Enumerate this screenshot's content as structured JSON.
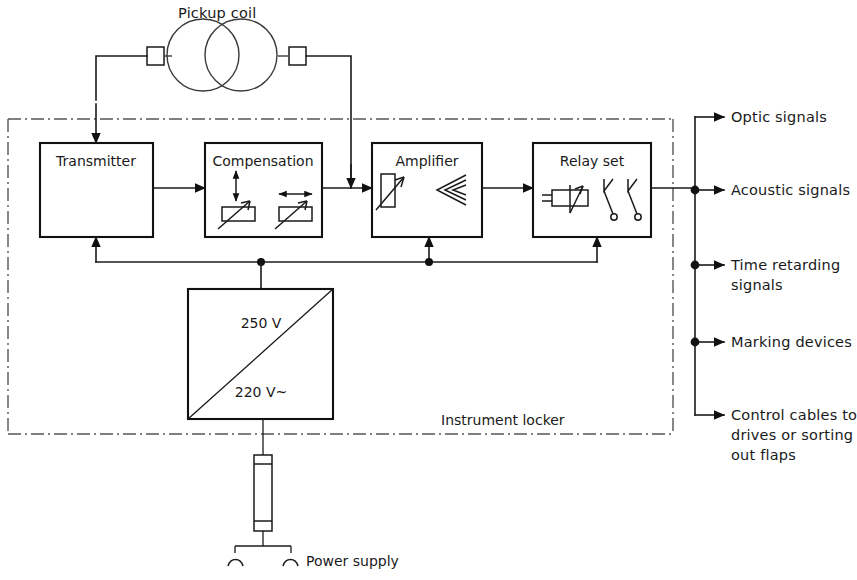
{
  "diagram": {
    "title_visible": false,
    "enclosure_label": "Instrument locker",
    "coil_label": "Pickup coil",
    "power_label": "Power supply",
    "colors": {
      "line": "#1a1a1a",
      "box_border": "#111111",
      "enclosure_border": "#555555",
      "background": "#ffffff"
    }
  },
  "blocks": [
    {
      "id": "transmitter",
      "label": "Transmitter",
      "x": 40,
      "y": 143,
      "w": 113,
      "h": 94
    },
    {
      "id": "compensation",
      "label": "Compensation",
      "x": 205,
      "y": 143,
      "w": 117,
      "h": 94
    },
    {
      "id": "amplifier",
      "label": "Amplifier",
      "x": 372,
      "y": 143,
      "w": 110,
      "h": 94
    },
    {
      "id": "relay-set",
      "label": "Relay set",
      "x": 533,
      "y": 143,
      "w": 118,
      "h": 94
    }
  ],
  "power_supply_block": {
    "label_top": "250 V",
    "label_bottom": "220 V~",
    "x": 188,
    "y": 289,
    "w": 145,
    "h": 130
  },
  "outputs": [
    {
      "id": "optic",
      "label": "Optic signals",
      "label2": "",
      "label3": "",
      "y": 117,
      "junction": false
    },
    {
      "id": "acoustic",
      "label": "Acoustic signals",
      "label2": "",
      "label3": "",
      "y": 190,
      "junction": true
    },
    {
      "id": "time-retarding",
      "label": "Time retarding",
      "label2": "signals",
      "label3": "",
      "y": 265,
      "junction": true
    },
    {
      "id": "marking",
      "label": "Marking devices",
      "label2": "",
      "label3": "",
      "y": 342,
      "junction": true
    },
    {
      "id": "control-cables",
      "label": "Control cables to",
      "label2": "drives or sorting",
      "label3": "out flaps",
      "y": 415,
      "junction": false
    }
  ]
}
